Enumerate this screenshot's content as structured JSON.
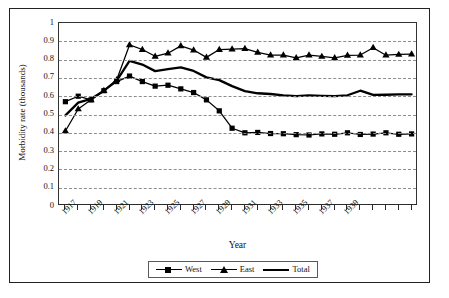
{
  "chart_data": {
    "type": "line",
    "title": "",
    "xlabel": "Year",
    "ylabel": "Morbidity rate (thousands)",
    "ylim": [
      0,
      1
    ],
    "ytick_values": [
      0,
      0.1,
      0.2,
      0.3,
      0.4,
      0.5,
      0.6,
      0.7,
      0.8,
      0.9,
      1
    ],
    "ytick_labels": [
      "0",
      "0.1",
      "0.2",
      "0.3",
      "0.4",
      "0.5",
      "0.6",
      "0.7",
      "0.8",
      "0.9",
      "1"
    ],
    "grid": true,
    "grid_style": "dashed-horizontal",
    "legend_position": "bottom-center",
    "x": [
      1917,
      1918,
      1919,
      1920,
      1921,
      1922,
      1923,
      1924,
      1925,
      1926,
      1927,
      1928,
      1929,
      1930,
      1931,
      1932,
      1933,
      1934,
      1935,
      1936,
      1937,
      1938,
      1939,
      1940,
      1941,
      1942,
      1943,
      1944
    ],
    "xtick_labels": [
      "1917",
      "",
      "1919",
      "",
      "1921",
      "",
      "1923",
      "",
      "1925",
      "",
      "1927",
      "",
      "1929",
      "",
      "1931",
      "",
      "1933",
      "",
      "1935",
      "",
      "1937",
      "",
      "1939",
      "",
      "",
      "",
      "",
      ""
    ],
    "xtick_labeled_years": [
      "1917",
      "1919",
      "1921",
      "1923",
      "1925",
      "1927",
      "1929",
      "1931",
      "1933",
      "1935",
      "1937",
      "1939"
    ],
    "series": [
      {
        "name": "West",
        "marker": "square",
        "line": "thin-with-markers",
        "color": "#000000",
        "values": [
          0.57,
          0.6,
          0.58,
          0.63,
          0.68,
          0.71,
          0.68,
          0.655,
          0.66,
          0.64,
          0.62,
          0.58,
          0.52,
          0.425,
          0.4,
          0.402,
          0.396,
          0.395,
          0.39,
          0.388,
          0.394,
          0.392,
          0.4,
          0.391,
          0.393,
          0.4,
          0.392,
          0.394
        ]
      },
      {
        "name": "East",
        "marker": "triangle",
        "line": "thin-with-markers",
        "color": "#000000",
        "values": [
          0.41,
          0.53,
          0.58,
          0.63,
          0.69,
          0.88,
          0.855,
          0.818,
          0.835,
          0.875,
          0.852,
          0.812,
          0.855,
          0.857,
          0.86,
          0.84,
          0.825,
          0.825,
          0.81,
          0.825,
          0.817,
          0.81,
          0.823,
          0.825,
          0.865,
          0.824,
          0.828,
          0.83
        ]
      },
      {
        "name": "Total",
        "marker": "none",
        "line": "thick",
        "color": "#000000",
        "values": [
          0.495,
          0.565,
          0.585,
          0.63,
          0.685,
          0.793,
          0.773,
          0.737,
          0.748,
          0.758,
          0.738,
          0.703,
          0.688,
          0.655,
          0.628,
          0.616,
          0.612,
          0.605,
          0.6,
          0.604,
          0.602,
          0.6,
          0.605,
          0.63,
          0.607,
          0.608,
          0.61,
          0.61
        ]
      }
    ]
  }
}
